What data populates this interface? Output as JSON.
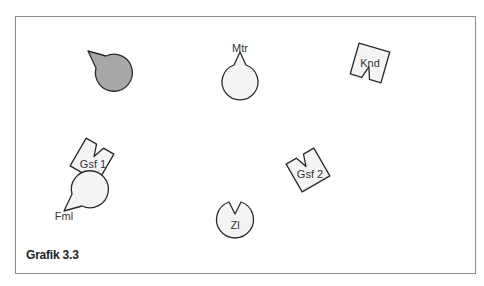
{
  "figure": {
    "caption": "Grafik 3.3"
  },
  "colors": {
    "outline": "#2a2a2a",
    "fill_light": "#f4f4f4",
    "fill_dark": "#a8a8a8",
    "frame": "#8a8a8a"
  },
  "shapes": [
    {
      "id": "unlabeled",
      "label": "",
      "kind": "circle",
      "fill": "dark",
      "cx": 88,
      "cy": 51
    },
    {
      "id": "mtr",
      "label": "Mtr",
      "kind": "circle",
      "fill": "light",
      "cx": 240,
      "cy": 48
    },
    {
      "id": "knd",
      "label": "Knd",
      "kind": "square",
      "fill": "light",
      "cx": 370,
      "cy": 63
    },
    {
      "id": "gsf1",
      "label": "Gsf 1",
      "kind": "square",
      "fill": "light",
      "cx": 92,
      "cy": 160
    },
    {
      "id": "gsf2",
      "label": "Gsf 2",
      "kind": "square",
      "fill": "light",
      "cx": 308,
      "cy": 170
    },
    {
      "id": "fml",
      "label": "Fml",
      "kind": "circle",
      "fill": "light",
      "cx": 64,
      "cy": 211
    },
    {
      "id": "zl",
      "label": "Zl",
      "kind": "circle",
      "fill": "light",
      "cx": 235,
      "cy": 220
    }
  ]
}
